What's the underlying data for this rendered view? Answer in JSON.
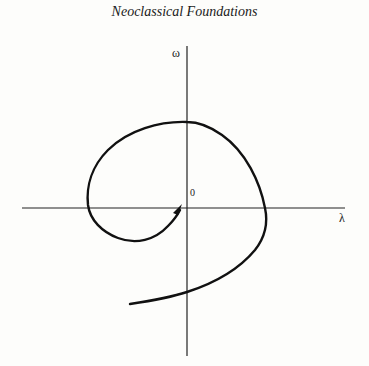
{
  "page": {
    "running_header": "Neoclassical Foundations"
  },
  "diagram": {
    "type": "phase-plane spiral",
    "axes": {
      "x_label": "λ",
      "y_label": "ω",
      "origin_label": "0"
    },
    "colors": {
      "ink": "#111111",
      "axis": "#222222",
      "background": "#fdfdfb"
    },
    "curve": {
      "description": "trajectory spiraling inward toward the origin, with an arrowhead near the origin",
      "direction": "inward (clockwise)"
    }
  }
}
